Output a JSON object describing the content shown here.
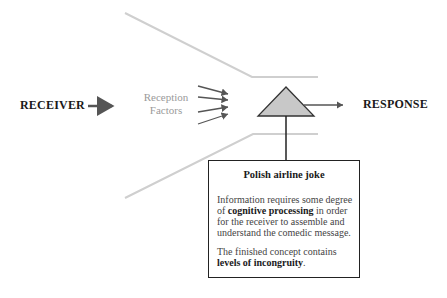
{
  "diagram": {
    "receiver_label": "RECEIVER",
    "reception_factors": [
      "Reception",
      "Factors"
    ],
    "response_label": "RESPONSE",
    "node_shape": "triangle",
    "colors": {
      "funnel": "#cfcfcf",
      "arrow": "#555555",
      "triangle_fill": "#c8c8c8",
      "text_dark": "#1a1a1a",
      "text_gray": "#9a9a9a"
    }
  },
  "info_box": {
    "title": "Polish airline joke",
    "paragraph1": {
      "pre": "Information requires some degree of ",
      "bold": "cognitive processing",
      "post": " in order for the receiver to assemble and understand the comedic message."
    },
    "paragraph2": {
      "pre": "The finished concept contains ",
      "bold": "levels of incongruity",
      "post": "."
    }
  }
}
